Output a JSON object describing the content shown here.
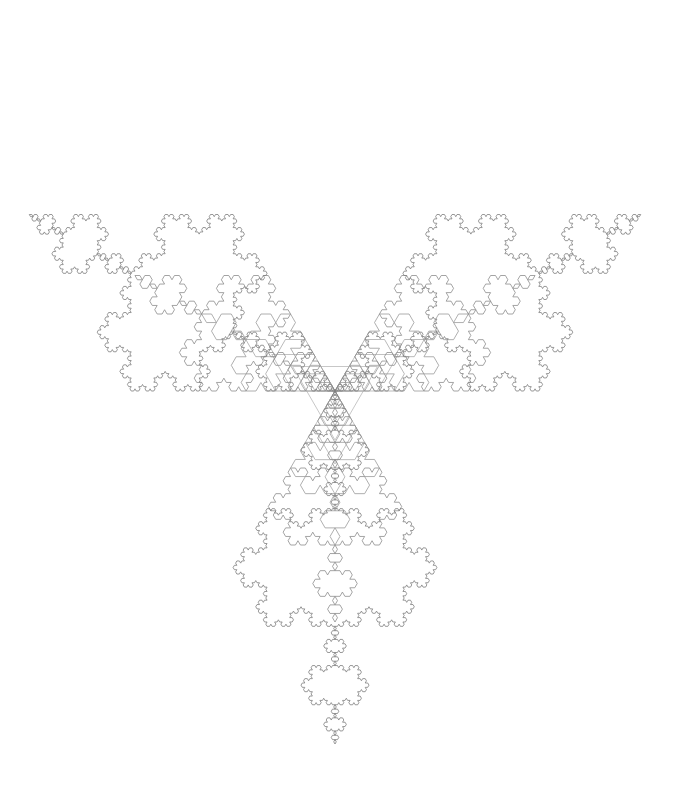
{
  "figure": {
    "type": "line-drawing",
    "canvas_width": 673,
    "canvas_height": 785,
    "background_color": "#ffffff",
    "center_x": 335,
    "center_y": 391,
    "orientation_note": "innermost triangle points downward (flat top, apex at bottom)",
    "base_rotation_degrees": 180
  },
  "chart_data": {
    "type": "line",
    "subtitle": "Six concentric Koch curves, iterations 0 through 5",
    "xlabel": "",
    "ylabel": "",
    "grid": false,
    "legend": "none",
    "center": [
      335,
      391
    ],
    "layers": [
      {
        "name": "iteration-0-triangle",
        "iteration": 0,
        "circumradius": 49,
        "top_tip_y": 342,
        "bottom_tip_y": 440,
        "stroke": "#b9b9b9",
        "stroke_width": 0.8,
        "segments": 3,
        "description": "equilateral triangle pointing down"
      },
      {
        "name": "iteration-1-star",
        "iteration": 1,
        "circumradius": 73,
        "top_tip_y": 318,
        "bottom_tip_y": 464,
        "stroke": "#b2b2b2",
        "stroke_width": 0.8,
        "segments": 12,
        "description": "six-pointed star of David"
      },
      {
        "name": "iteration-2-snowflake",
        "iteration": 2,
        "circumradius": 103,
        "top_tip_y": 288,
        "bottom_tip_y": 494,
        "stroke": "#a8a8a8",
        "stroke_width": 0.8,
        "segments": 48
      },
      {
        "name": "iteration-3-snowflake",
        "iteration": 3,
        "circumradius": 154,
        "top_tip_y": 237,
        "bottom_tip_y": 545,
        "stroke": "#9a9a9a",
        "stroke_width": 0.8,
        "segments": 192
      },
      {
        "name": "iteration-4-snowflake",
        "iteration": 4,
        "circumradius": 231,
        "top_tip_y": 160,
        "bottom_tip_y": 622,
        "stroke": "#8d8d8d",
        "stroke_width": 0.8,
        "segments": 768
      },
      {
        "name": "iteration-5-snowflake",
        "iteration": 5,
        "circumradius": 353,
        "top_tip_y": 38,
        "bottom_tip_y": 744,
        "stroke": "#7f7f7f",
        "stroke_width": 0.8,
        "segments": 3072
      }
    ],
    "extents": {
      "left_x": 35,
      "right_x": 635,
      "top_y": 38,
      "bottom_y": 744
    }
  }
}
